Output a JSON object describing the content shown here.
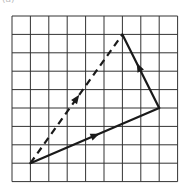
{
  "figure": {
    "label": "(a)",
    "grid": {
      "columns": 9,
      "rows": 9,
      "origin_px": [
        12,
        16
      ],
      "cell_px": 18.4,
      "line_color": "#333333"
    },
    "vectors": [
      {
        "name": "vector-a",
        "style": "solid",
        "from": [
          1,
          8
        ],
        "to": [
          8,
          5
        ],
        "arrow_at": 0.5,
        "color": "#1a1a1a"
      },
      {
        "name": "vector-b",
        "style": "solid",
        "from": [
          8,
          5
        ],
        "to": [
          6,
          1
        ],
        "arrow_at": 0.55,
        "color": "#1a1a1a"
      },
      {
        "name": "resultant-vector",
        "style": "dashed",
        "from": [
          1,
          8
        ],
        "to": [
          6,
          1
        ],
        "arrow_at": 0.5,
        "color": "#1a1a1a"
      }
    ]
  }
}
